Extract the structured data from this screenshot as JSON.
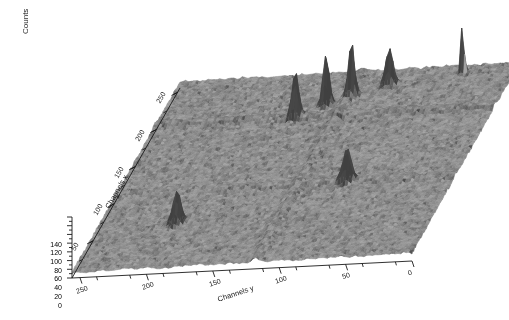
{
  "figure": {
    "background_color": "#ffffff",
    "surface_color": "#a3a3a3",
    "surface_color_dark": "#6f6f6f",
    "axis_color": "#1a1a1a",
    "plot_type": "3d-surface-mesh"
  },
  "axes": {
    "vertical": {
      "title": "Counts",
      "ticks": [
        0,
        20,
        40,
        60,
        80,
        100,
        120,
        140
      ],
      "min": 0,
      "max": 140
    },
    "left": {
      "title": "Channels x",
      "ticks": [
        50,
        100,
        150,
        200,
        250
      ],
      "min": 0,
      "max": 256
    },
    "bottom": {
      "title": "Channels y",
      "ticks": [
        250,
        200,
        150,
        100,
        50,
        0
      ],
      "min": 0,
      "max": 256
    }
  },
  "chart_data": {
    "type": "surface",
    "title": "",
    "xlabel": "Channels x",
    "ylabel": "Channels y",
    "zlabel": "Counts",
    "xlim": [
      0,
      256
    ],
    "ylim": [
      0,
      256
    ],
    "zlim": [
      0,
      140
    ],
    "grid": false,
    "legend": "none",
    "background_level": 18,
    "noise_amplitude": 7,
    "peaks": [
      {
        "x": 60,
        "y": 196,
        "height": 74,
        "width": 3.0,
        "label": "peak-left-front"
      },
      {
        "x": 196,
        "y": 150,
        "height": 96,
        "width": 2.4,
        "label": "peak-cluster-1"
      },
      {
        "x": 212,
        "y": 132,
        "height": 124,
        "width": 2.2,
        "label": "peak-cluster-2"
      },
      {
        "x": 222,
        "y": 116,
        "height": 118,
        "width": 2.2,
        "label": "peak-cluster-3"
      },
      {
        "x": 236,
        "y": 92,
        "height": 82,
        "width": 2.6,
        "label": "peak-cluster-4"
      },
      {
        "x": 104,
        "y": 82,
        "height": 70,
        "width": 3.0,
        "label": "peak-front-right"
      },
      {
        "x": 246,
        "y": 40,
        "height": 140,
        "width": 1.1,
        "label": "peak-tall-back-right"
      }
    ],
    "ridges": [
      {
        "axis": "x",
        "at": 196,
        "amplitude": 9,
        "label": "ridge-x-196"
      },
      {
        "axis": "y",
        "at": 118,
        "amplitude": 8,
        "label": "ridge-y-118"
      },
      {
        "axis": "x",
        "at": 104,
        "amplitude": 6,
        "label": "ridge-x-104"
      }
    ]
  }
}
